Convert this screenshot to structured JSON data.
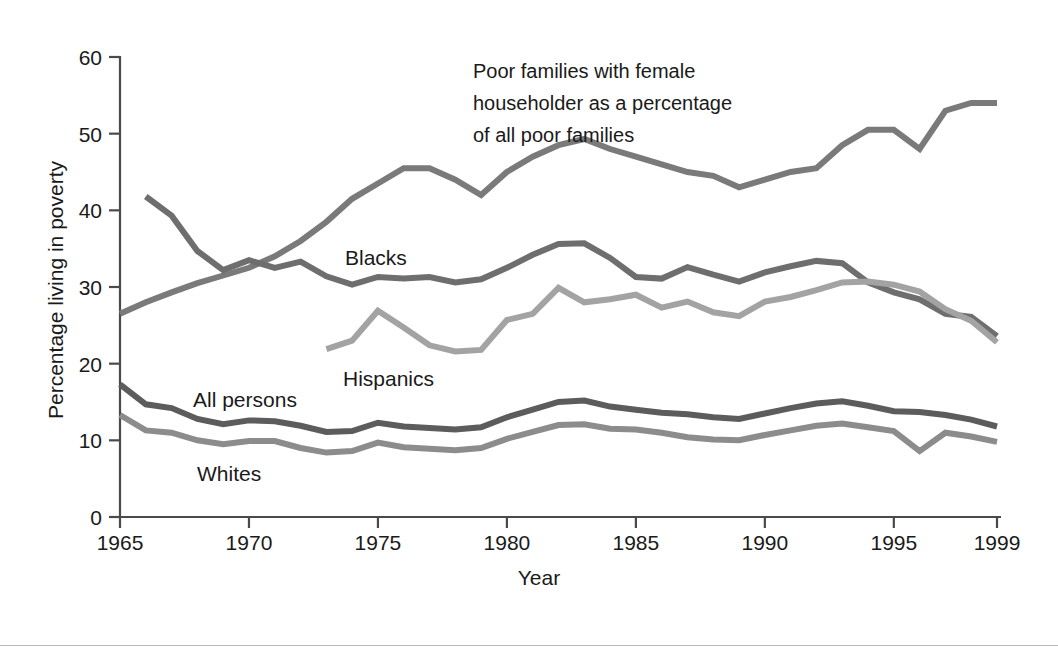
{
  "chart_data": {
    "type": "line",
    "title": "",
    "xlabel": "Year",
    "ylabel": "Percentage living in poverty",
    "xlim": [
      1965,
      1999
    ],
    "ylim": [
      0,
      60
    ],
    "xticks": [
      1965,
      1970,
      1975,
      1980,
      1985,
      1990,
      1995,
      1999
    ],
    "yticks": [
      0,
      10,
      20,
      30,
      40,
      50,
      60
    ],
    "grid": false,
    "legend": "inline-labels",
    "annotations": [
      {
        "name": "female-householder-note",
        "lines": [
          "Poor families with female",
          "householder as a percentage",
          "of all poor families"
        ],
        "x": 1979,
        "y": 57.5
      }
    ],
    "series": [
      {
        "name": "Poor families with female householder as a percentage of all poor families",
        "label": "",
        "color": "#7a7a7a",
        "width": 6,
        "x": [
          1965,
          1966,
          1967,
          1968,
          1969,
          1970,
          1971,
          1972,
          1973,
          1974,
          1975,
          1976,
          1977,
          1978,
          1979,
          1980,
          1981,
          1982,
          1983,
          1984,
          1985,
          1986,
          1987,
          1988,
          1989,
          1990,
          1991,
          1992,
          1993,
          1994,
          1995,
          1996,
          1997,
          1998,
          1999
        ],
        "y": [
          26.5,
          28.0,
          29.3,
          30.5,
          31.5,
          32.5,
          34.0,
          36.0,
          38.5,
          41.5,
          43.5,
          45.5,
          45.5,
          44.0,
          42.0,
          45.0,
          47.0,
          48.5,
          49.3,
          48.0,
          47.0,
          46.0,
          45.0,
          44.5,
          43.0,
          44.0,
          45.0,
          45.5,
          48.5,
          50.5,
          50.5,
          48.0,
          53.0,
          54.0,
          54.0
        ],
        "y_tail": []
      },
      {
        "name": "Blacks",
        "label": "Blacks",
        "color": "#6e6e6e",
        "width": 6,
        "x": [
          1966,
          1967,
          1968,
          1969,
          1970,
          1971,
          1972,
          1973,
          1974,
          1975,
          1976,
          1977,
          1978,
          1979,
          1980,
          1981,
          1982,
          1983,
          1984,
          1985,
          1986,
          1987,
          1988,
          1989,
          1990,
          1991,
          1992,
          1993,
          1994,
          1995,
          1996,
          1997,
          1998,
          1999
        ],
        "y": [
          41.8,
          39.3,
          34.7,
          32.2,
          33.5,
          32.5,
          33.3,
          31.4,
          30.3,
          31.3,
          31.1,
          31.3,
          30.6,
          31.0,
          32.5,
          34.2,
          35.6,
          35.7,
          33.8,
          31.3,
          31.1,
          32.6,
          31.6,
          30.7,
          31.9,
          32.7,
          33.4,
          33.1,
          30.6,
          29.3,
          28.4,
          26.5,
          26.1,
          23.6
        ]
      },
      {
        "name": "Hispanics",
        "label": "Hispanics",
        "color": "#a3a3a3",
        "width": 6,
        "x": [
          1973,
          1974,
          1975,
          1976,
          1977,
          1978,
          1979,
          1980,
          1981,
          1982,
          1983,
          1984,
          1985,
          1986,
          1987,
          1988,
          1989,
          1990,
          1991,
          1992,
          1993,
          1994,
          1995,
          1996,
          1997,
          1998,
          1999
        ],
        "y": [
          21.9,
          23.0,
          26.9,
          24.7,
          22.4,
          21.6,
          21.8,
          25.7,
          26.5,
          29.9,
          28.0,
          28.4,
          29.0,
          27.3,
          28.1,
          26.7,
          26.2,
          28.1,
          28.7,
          29.6,
          30.6,
          30.7,
          30.3,
          29.4,
          27.1,
          25.6,
          22.8
        ]
      },
      {
        "name": "All persons",
        "label": "All persons",
        "color": "#5c5c5c",
        "width": 6,
        "x": [
          1965,
          1966,
          1967,
          1968,
          1969,
          1970,
          1971,
          1972,
          1973,
          1974,
          1975,
          1976,
          1977,
          1978,
          1979,
          1980,
          1981,
          1982,
          1983,
          1984,
          1985,
          1986,
          1987,
          1988,
          1989,
          1990,
          1991,
          1992,
          1993,
          1994,
          1995,
          1996,
          1997,
          1998,
          1999
        ],
        "y": [
          17.3,
          14.7,
          14.2,
          12.8,
          12.1,
          12.6,
          12.5,
          11.9,
          11.1,
          11.2,
          12.3,
          11.8,
          11.6,
          11.4,
          11.7,
          13.0,
          14.0,
          15.0,
          15.2,
          14.4,
          14.0,
          13.6,
          13.4,
          13.0,
          12.8,
          13.5,
          14.2,
          14.8,
          15.1,
          14.5,
          13.8,
          13.7,
          13.3,
          12.7,
          11.8
        ]
      },
      {
        "name": "Whites",
        "label": "Whites",
        "color": "#8c8c8c",
        "width": 6,
        "x": [
          1965,
          1966,
          1967,
          1968,
          1969,
          1970,
          1971,
          1972,
          1973,
          1974,
          1975,
          1976,
          1977,
          1978,
          1979,
          1980,
          1981,
          1982,
          1983,
          1984,
          1985,
          1986,
          1987,
          1988,
          1989,
          1990,
          1991,
          1992,
          1993,
          1994,
          1995,
          1996,
          1997,
          1998,
          1999
        ],
        "y": [
          13.3,
          11.3,
          11.0,
          10.0,
          9.5,
          9.9,
          9.9,
          9.0,
          8.4,
          8.6,
          9.7,
          9.1,
          8.9,
          8.7,
          9.0,
          10.2,
          11.1,
          12.0,
          12.1,
          11.5,
          11.4,
          11.0,
          10.4,
          10.1,
          10.0,
          10.7,
          11.3,
          11.9,
          12.2,
          11.7,
          11.2,
          8.6,
          11.0,
          10.5,
          9.8
        ]
      }
    ]
  },
  "axes": {
    "x_tick_labels": [
      "1965",
      "1970",
      "1975",
      "1980",
      "1985",
      "1990",
      "1995",
      "1999"
    ],
    "y_tick_labels": [
      "0",
      "10",
      "20",
      "30",
      "40",
      "50",
      "60"
    ],
    "x_title": "Year",
    "y_title": "Percentage living in poverty"
  },
  "labels": {
    "blacks": "Blacks",
    "hispanics": "Hispanics",
    "all_persons": "All persons",
    "whites": "Whites"
  },
  "annotation": {
    "line1": "Poor families with female",
    "line2": "householder as a percentage",
    "line3": "of all poor families"
  },
  "colors": {
    "female_householder": "#7a7a7a",
    "blacks": "#6e6e6e",
    "hispanics": "#a3a3a3",
    "all_persons": "#5c5c5c",
    "whites": "#8c8c8c",
    "axis": "#4a4a4a",
    "text": "#1a1a1a",
    "background": "#ffffff"
  }
}
